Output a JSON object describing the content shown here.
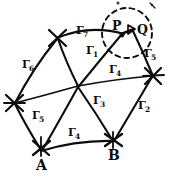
{
  "figure": {
    "kind": "hand-drawn geodetic triangulation network sketch",
    "background_color": "#ffffff",
    "ink_color": "#0d0d0d",
    "width": 170,
    "height": 181
  },
  "vertices": [
    {
      "id": "A",
      "label": "A",
      "x": 41,
      "y": 150,
      "mark": "x-cross",
      "label_x": 36,
      "label_y": 158
    },
    {
      "id": "B",
      "label": "B",
      "x": 113,
      "y": 141,
      "mark": "x-cross",
      "label_x": 108,
      "label_y": 148
    },
    {
      "id": "P",
      "label": "P",
      "x": 122,
      "y": 33,
      "mark": "dot",
      "label_x": 112,
      "label_y": 20
    },
    {
      "id": "Q",
      "label": "Q",
      "x": 134,
      "y": 30,
      "mark": "arrow",
      "label_x": 137,
      "label_y": 24
    },
    {
      "id": "V1",
      "label": "",
      "x": 57,
      "y": 38,
      "mark": "x-cross",
      "label_x": 0,
      "label_y": 0
    },
    {
      "id": "V2",
      "label": "",
      "x": 14,
      "y": 103,
      "mark": "x-cross",
      "label_x": 0,
      "label_y": 0
    },
    {
      "id": "V3",
      "label": "",
      "x": 78,
      "y": 86,
      "mark": "junction",
      "label_x": 0,
      "label_y": 0
    },
    {
      "id": "V4",
      "label": "",
      "x": 153,
      "y": 76,
      "mark": "x-cross",
      "label_x": 0,
      "label_y": 0
    }
  ],
  "edge_labels": [
    {
      "id": "g7",
      "base": "Γ",
      "sub": "7",
      "x": 76,
      "y": 25
    },
    {
      "id": "g1",
      "base": "Γ",
      "sub": "1",
      "x": 86,
      "y": 45
    },
    {
      "id": "g6",
      "base": "Γ",
      "sub": "6",
      "x": 22,
      "y": 59
    },
    {
      "id": "g4b",
      "base": "Γ",
      "sub": "4",
      "x": 109,
      "y": 64
    },
    {
      "id": "g5r",
      "base": "Γ",
      "sub": "5",
      "x": 144,
      "y": 48
    },
    {
      "id": "g3",
      "base": "Γ",
      "sub": "3",
      "x": 93,
      "y": 95
    },
    {
      "id": "g2",
      "base": "Γ",
      "sub": "2",
      "x": 138,
      "y": 100
    },
    {
      "id": "g5l",
      "base": "Γ",
      "sub": "5",
      "x": 32,
      "y": 110
    },
    {
      "id": "g4",
      "base": "Γ",
      "sub": "4",
      "x": 68,
      "y": 127
    }
  ],
  "target_circle": {
    "name": "dashed-target-circle",
    "cx": 127,
    "cy": 33,
    "r": 25,
    "dash": "dashed"
  }
}
